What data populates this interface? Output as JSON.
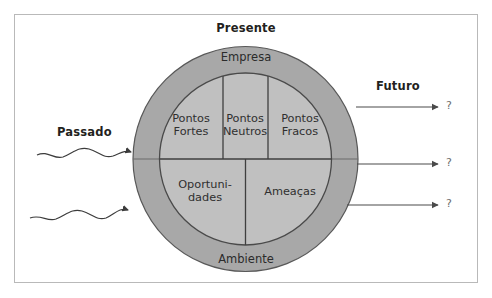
{
  "diagram": {
    "title_top": "Presente",
    "label_left": "Passado",
    "label_right": "Futuro",
    "ring": {
      "top_label": "Empresa",
      "bottom_label": "Ambiente"
    },
    "cells": {
      "top_left": {
        "line1": "Pontos",
        "line2": "Fortes"
      },
      "top_center": {
        "line1": "Pontos",
        "line2": "Neutros"
      },
      "top_right": {
        "line1": "Pontos",
        "line2": "Fracos"
      },
      "bottom_left": {
        "line1": "Oportuni-",
        "line2": "dades"
      },
      "bottom_right": {
        "line1": "Ameaças",
        "line2": ""
      }
    },
    "future_markers": [
      "?",
      "?",
      "?"
    ],
    "colors": {
      "ring_fill": "#a8a8a8",
      "inner_fill": "#c0c0c0",
      "stroke": "#4a4a4a",
      "frame_border": "#b9b9b9",
      "text": "#231f20",
      "muted_text": "#6d6d6d",
      "background": "#ffffff"
    }
  }
}
